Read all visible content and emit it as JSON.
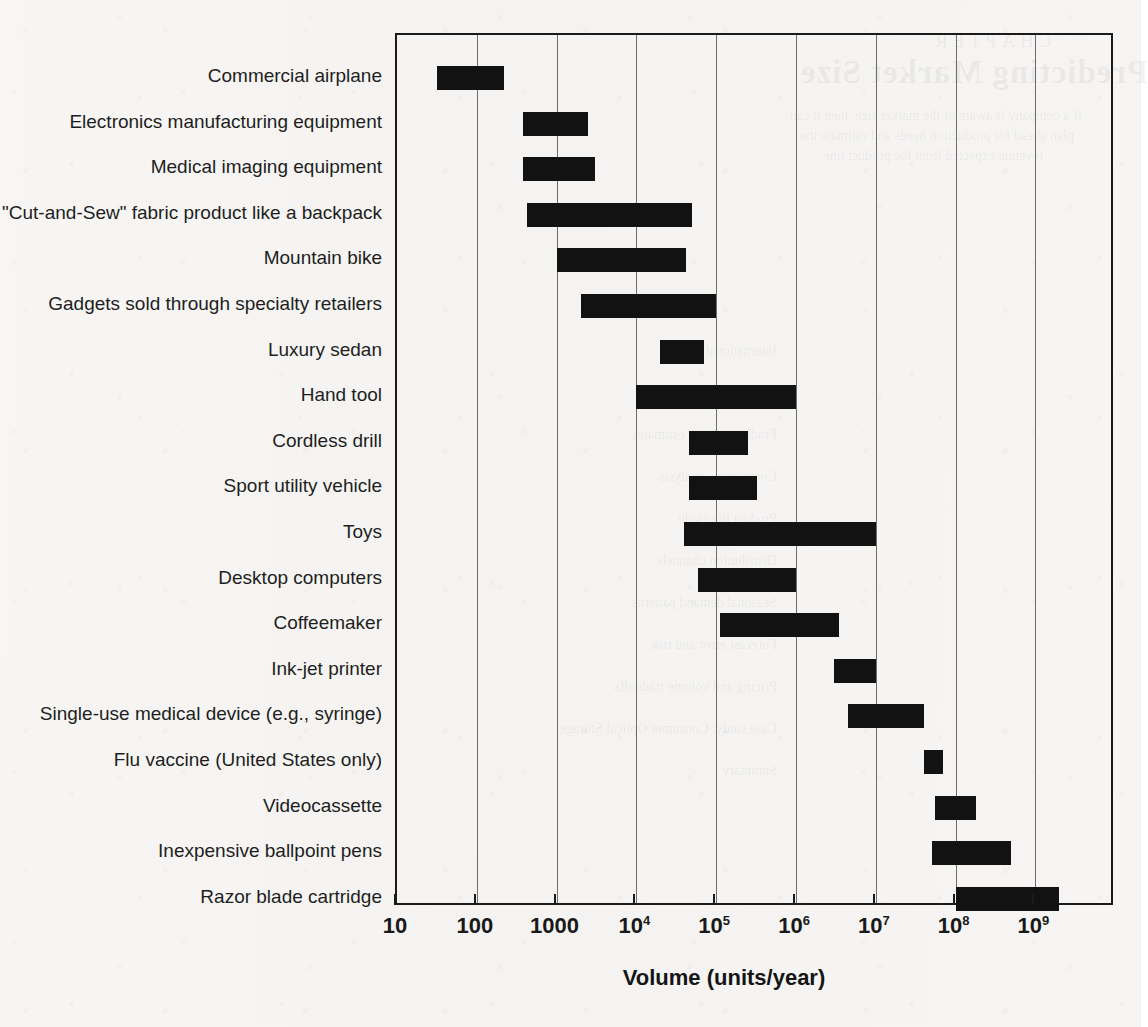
{
  "chart_data": {
    "type": "bar",
    "orientation": "horizontal-range",
    "title": "",
    "xlabel": "Volume (units/year)",
    "ylabel": "",
    "xscale": "log",
    "xlim": [
      10,
      5000000000
    ],
    "grid": "vertical",
    "legend": "none",
    "x_tick_labels": [
      "10",
      "100",
      "1000",
      "10⁴",
      "10⁵",
      "10⁶",
      "10⁷",
      "10⁸",
      "10⁹"
    ],
    "x_tick_values": [
      10,
      100,
      1000,
      10000,
      100000,
      1000000,
      10000000,
      100000000,
      1000000000
    ],
    "categories": [
      "Commercial airplane",
      "Electronics manufacturing equipment",
      "Medical imaging equipment",
      "\"Cut-and-Sew\" fabric product like a backpack",
      "Mountain bike",
      "Gadgets sold through specialty retailers",
      "Luxury sedan",
      "Hand tool",
      "Cordless drill",
      "Sport utility vehicle",
      "Toys",
      "Desktop computers",
      "Coffeemaker",
      "Ink-jet printer",
      "Single-use medical device (e.g., syringe)",
      "Flu vaccine (United States only)",
      "Videocassette",
      "Inexpensive ballpoint pens",
      "Razor blade cartridge"
    ],
    "ranges": [
      {
        "category": "Commercial airplane",
        "low": 32,
        "high": 220
      },
      {
        "category": "Electronics manufacturing equipment",
        "low": 380,
        "high": 2500
      },
      {
        "category": "Medical imaging equipment",
        "low": 380,
        "high": 3000
      },
      {
        "category": "\"Cut-and-Sew\" fabric product like a backpack",
        "low": 420,
        "high": 50000
      },
      {
        "category": "Mountain bike",
        "low": 1000,
        "high": 42000
      },
      {
        "category": "Gadgets sold through specialty retailers",
        "low": 2000,
        "high": 100000
      },
      {
        "category": "Luxury sedan",
        "low": 20000,
        "high": 70000
      },
      {
        "category": "Hand tool",
        "low": 10000,
        "high": 1000000
      },
      {
        "category": "Cordless drill",
        "low": 45000,
        "high": 250000
      },
      {
        "category": "Sport utility vehicle",
        "low": 45000,
        "high": 320000
      },
      {
        "category": "Toys",
        "low": 40000,
        "high": 10000000
      },
      {
        "category": "Desktop computers",
        "low": 60000,
        "high": 1000000
      },
      {
        "category": "Coffeemaker",
        "low": 110000,
        "high": 3500000
      },
      {
        "category": "Ink-jet printer",
        "low": 3000000,
        "high": 10000000
      },
      {
        "category": "Single-use medical device (e.g., syringe)",
        "low": 4500000,
        "high": 40000000
      },
      {
        "category": "Flu vaccine (United States only)",
        "low": 40000000,
        "high": 70000000
      },
      {
        "category": "Videocassette",
        "low": 55000000,
        "high": 180000000
      },
      {
        "category": "Inexpensive ballpoint pens",
        "low": 50000000,
        "high": 500000000
      },
      {
        "category": "Razor blade cartridge",
        "low": 100000000,
        "high": 2000000000
      }
    ],
    "colors": {
      "bar": "#121212",
      "axis": "#1b1b1b",
      "grid": "#6d6d6d",
      "text": "#1e1e1e",
      "background": "#f6f5f3"
    }
  },
  "ghost_text": {
    "chapter": "CHAPTER",
    "title": "Predicting Market Size",
    "line_a": "If a company is aware of the market size, then it can",
    "line_b": "plan ahead for production needs and estimate the",
    "line_c": "revenue expected from the product line.",
    "toc": [
      "International markets",
      "Market share",
      "Product volume estimates",
      "Competitive analysis",
      "Product life cycle",
      "Distribution channels",
      "Seasonal demand patterns",
      "Forecast error and risk",
      "Pricing and volume tradeoffs",
      "Case study: Consumer Optical Storage",
      "Summary"
    ]
  }
}
